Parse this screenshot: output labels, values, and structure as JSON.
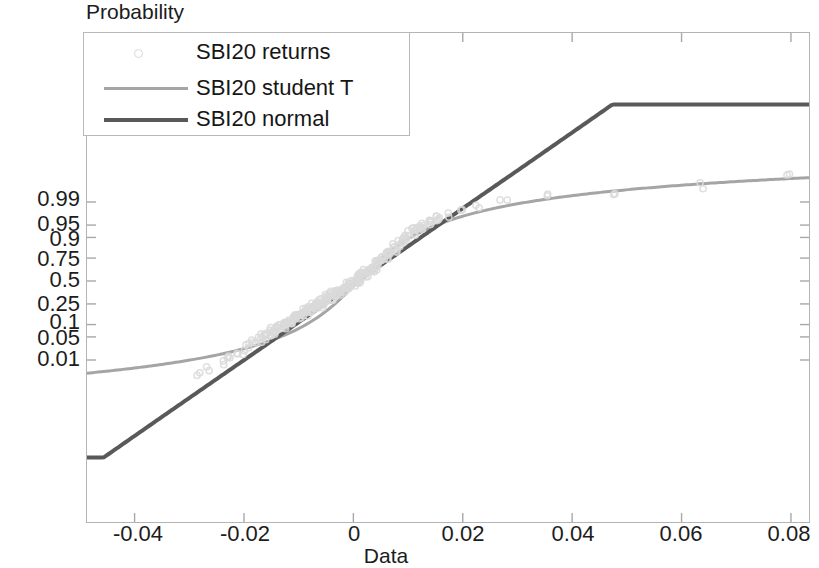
{
  "chart_data": {
    "type": "scatter",
    "title": "",
    "xlabel": "Data",
    "ylabel": "Probability",
    "xlim": [
      -0.0487,
      0.0833
    ],
    "xticks": [
      -0.04,
      -0.02,
      0,
      0.02,
      0.04,
      0.06,
      0.08
    ],
    "xtick_labels": [
      "-0.04",
      "-0.02",
      "0",
      "0.02",
      "0.04",
      "0.06",
      "0.08"
    ],
    "yscale": "probability (normal probit)",
    "yticks": [
      0.01,
      0.05,
      0.1,
      0.25,
      0.5,
      0.75,
      0.9,
      0.95,
      0.99
    ],
    "ytick_labels": [
      "0.01",
      "0.05",
      "0.1",
      "0.25",
      "0.5",
      "0.75",
      "0.9",
      "0.95",
      "0.99"
    ],
    "grid": false,
    "legend_position": "top-left",
    "series": [
      {
        "name": "SBI20 returns",
        "style": "scatter-circles",
        "color": "#d9d9d9",
        "points": [
          [
            -0.0285,
            0.0035
          ],
          [
            -0.0262,
            0.0055
          ],
          [
            -0.0244,
            0.008
          ],
          [
            -0.0231,
            0.011
          ],
          [
            -0.022,
            0.015
          ],
          [
            -0.0209,
            0.0195
          ],
          [
            -0.0199,
            0.0245
          ],
          [
            -0.019,
            0.03
          ],
          [
            -0.0181,
            0.036
          ],
          [
            -0.0173,
            0.0425
          ],
          [
            -0.0166,
            0.0495
          ],
          [
            -0.0158,
            0.057
          ],
          [
            -0.0151,
            0.065
          ],
          [
            -0.0144,
            0.0735
          ],
          [
            -0.0138,
            0.0825
          ],
          [
            -0.0131,
            0.092
          ],
          [
            -0.0125,
            0.102
          ],
          [
            -0.0119,
            0.1125
          ],
          [
            -0.0113,
            0.1235
          ],
          [
            -0.0107,
            0.135
          ],
          [
            -0.0101,
            0.147
          ],
          [
            -0.0096,
            0.1595
          ],
          [
            -0.009,
            0.1725
          ],
          [
            -0.0085,
            0.186
          ],
          [
            -0.0079,
            0.2
          ],
          [
            -0.0074,
            0.2145
          ],
          [
            -0.0069,
            0.2295
          ],
          [
            -0.0064,
            0.245
          ],
          [
            -0.0059,
            0.261
          ],
          [
            -0.0054,
            0.2775
          ],
          [
            -0.0049,
            0.2945
          ],
          [
            -0.0044,
            0.312
          ],
          [
            -0.0039,
            0.33
          ],
          [
            -0.0034,
            0.3485
          ],
          [
            -0.0029,
            0.3675
          ],
          [
            -0.0024,
            0.387
          ],
          [
            -0.0019,
            0.407
          ],
          [
            -0.0014,
            0.4275
          ],
          [
            -0.0009,
            0.4485
          ],
          [
            -0.0004,
            0.47
          ],
          [
            0.0001,
            0.492
          ],
          [
            0.0006,
            0.5145
          ],
          [
            0.0011,
            0.5375
          ],
          [
            0.0016,
            0.561
          ],
          [
            0.0021,
            0.585
          ],
          [
            0.0026,
            0.6095
          ],
          [
            0.0031,
            0.6345
          ],
          [
            0.0037,
            0.66
          ],
          [
            0.0042,
            0.686
          ],
          [
            0.0048,
            0.7125
          ],
          [
            0.0054,
            0.7395
          ],
          [
            0.006,
            0.767
          ],
          [
            0.0066,
            0.795
          ],
          [
            0.0073,
            0.8235
          ],
          [
            0.008,
            0.8525
          ],
          [
            0.0088,
            0.882
          ],
          [
            0.0096,
            0.9
          ],
          [
            0.0105,
            0.918
          ],
          [
            0.0115,
            0.934
          ],
          [
            0.0126,
            0.947
          ],
          [
            0.0139,
            0.958
          ],
          [
            0.0154,
            0.967
          ],
          [
            0.0172,
            0.9745
          ],
          [
            0.0194,
            0.9805
          ],
          [
            0.0225,
            0.9855
          ],
          [
            0.0275,
            0.9895
          ],
          [
            0.036,
            0.993
          ],
          [
            0.048,
            0.9955
          ],
          [
            0.064,
            0.9975
          ],
          [
            0.079,
            0.999
          ]
        ]
      },
      {
        "name": "SBI20 student T",
        "style": "line",
        "color": "#a5a5a5",
        "width": 3,
        "description": "Student-T fitted CDF, S-shaped, flattens at both ends"
      },
      {
        "name": "SBI20 normal",
        "style": "line",
        "color": "#595959",
        "width": 4,
        "description": "Normal fitted CDF, straight line on probability paper"
      }
    ]
  },
  "axes": {
    "ylabel": "Probability",
    "xlabel": "Data",
    "xtick_labels": [
      "-0.04",
      "-0.02",
      "0",
      "0.02",
      "0.04",
      "0.06",
      "0.08"
    ],
    "ytick_labels": [
      "0.99",
      "0.95",
      "0.9",
      "0.75",
      "0.5",
      "0.25",
      "0.1",
      "0.05",
      "0.01"
    ]
  },
  "legend": {
    "entries": [
      {
        "label": "SBI20 returns",
        "marker": "circle",
        "color": "#d9d9d9"
      },
      {
        "label": "SBI20 student T",
        "marker": "line",
        "color": "#a5a5a5"
      },
      {
        "label": "SBI20 normal",
        "marker": "line",
        "color": "#595959"
      }
    ]
  }
}
